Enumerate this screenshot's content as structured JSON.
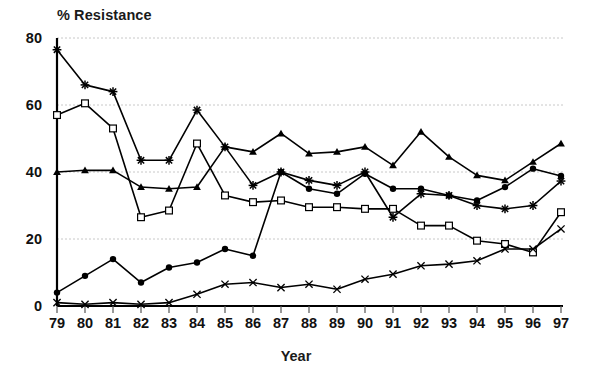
{
  "chart_data": {
    "type": "line",
    "title": "% Resistance",
    "xlabel": "Year",
    "ylabel": "",
    "grid": true,
    "legend": "none",
    "xlim": [
      1979,
      1997
    ],
    "ylim": [
      0,
      80
    ],
    "ytick_values": [
      0,
      20,
      40,
      60,
      80
    ],
    "ytick_labels": [
      "0",
      "20",
      "40",
      "60",
      "80"
    ],
    "categories": [
      "79",
      "80",
      "81",
      "82",
      "83",
      "84",
      "85",
      "86",
      "87",
      "88",
      "89",
      "90",
      "91",
      "92",
      "93",
      "94",
      "95",
      "96",
      "97"
    ],
    "x": [
      1979,
      1980,
      1981,
      1982,
      1983,
      1984,
      1985,
      1986,
      1987,
      1988,
      1989,
      1990,
      1991,
      1992,
      1993,
      1994,
      1995,
      1996,
      1997
    ],
    "series": [
      {
        "name": "series-star",
        "marker": "star",
        "values": [
          76.5,
          66.0,
          64.0,
          43.5,
          43.5,
          58.5,
          47.5,
          36.0,
          40.0,
          37.5,
          36.0,
          40.0,
          26.5,
          33.5,
          33.0,
          30.0,
          29.0,
          30.0,
          37.3
        ]
      },
      {
        "name": "series-square",
        "marker": "open-square",
        "values": [
          57.0,
          60.5,
          53.0,
          26.5,
          28.5,
          48.5,
          33.0,
          31.0,
          31.5,
          29.5,
          29.5,
          29.0,
          29.0,
          24.0,
          24.0,
          19.5,
          18.5,
          16.0,
          28.0
        ]
      },
      {
        "name": "series-triangle",
        "marker": "filled-triangle",
        "values": [
          40.0,
          40.5,
          40.5,
          35.5,
          35.0,
          35.5,
          47.5,
          46.0,
          51.5,
          45.5,
          46.0,
          47.5,
          42.0,
          52.0,
          44.5,
          39.0,
          37.5,
          43.0,
          48.5
        ]
      },
      {
        "name": "series-circle",
        "marker": "filled-circle",
        "values": [
          4.0,
          9.0,
          14.0,
          7.0,
          11.5,
          13.0,
          17.0,
          15.0,
          40.0,
          35.0,
          33.5,
          39.5,
          35.0,
          35.0,
          33.0,
          31.5,
          35.5,
          41.0,
          38.8
        ]
      },
      {
        "name": "series-cross",
        "marker": "cross",
        "values": [
          1.0,
          0.5,
          1.0,
          0.5,
          1.0,
          3.5,
          6.5,
          7.0,
          5.5,
          6.5,
          5.0,
          8.0,
          9.5,
          12.0,
          12.5,
          13.5,
          17.0,
          17.0,
          23.0
        ]
      }
    ]
  },
  "axes": {
    "x_tick_labels": [
      "79",
      "80",
      "81",
      "82",
      "83",
      "84",
      "85",
      "86",
      "87",
      "88",
      "89",
      "90",
      "91",
      "92",
      "93",
      "94",
      "95",
      "96",
      "97"
    ],
    "y_tick_labels": [
      "80",
      "60",
      "40",
      "20",
      "0"
    ]
  },
  "colors": {
    "line": "#000000",
    "grid": "#c8c8c8",
    "axis": "#000000",
    "text": "#111111"
  }
}
